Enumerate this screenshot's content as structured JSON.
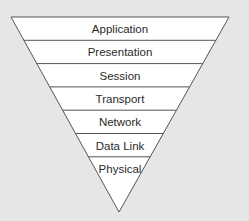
{
  "diagram": {
    "shape": "inverted-triangle",
    "layers": [
      {
        "label": "Application"
      },
      {
        "label": "Presentation"
      },
      {
        "label": "Session"
      },
      {
        "label": "Transport"
      },
      {
        "label": "Network"
      },
      {
        "label": "Data Link"
      },
      {
        "label": "Physical"
      }
    ],
    "colors": {
      "background": "#e6e6e6",
      "fill": "#ffffff",
      "stroke": "#555555",
      "text": "#2a2a2a"
    }
  }
}
